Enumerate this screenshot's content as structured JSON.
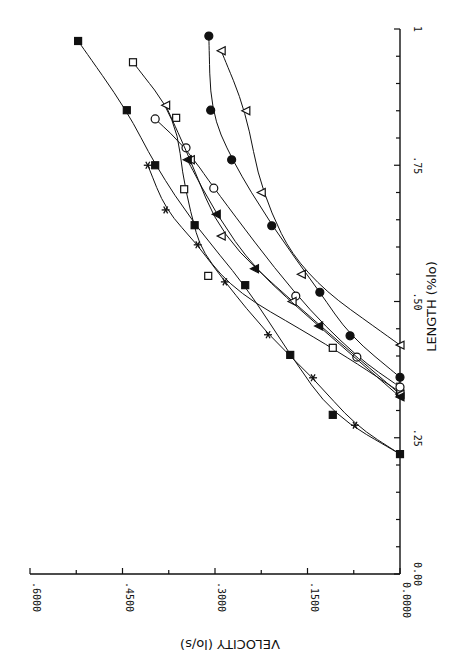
{
  "chart_data": {
    "type": "line",
    "orientation": "rotated-90-clockwise (page rotated; x axis drawn vertically on right, y axis drawn horizontally at bottom)",
    "title": "",
    "xlabel": "LENGTH (%lo)",
    "ylabel": "VELOCITY (lo/s)",
    "xlim": [
      0,
      1
    ],
    "ylim": [
      0,
      0.6
    ],
    "x_ticks": [
      "0.00",
      ".25",
      ".50",
      ".75",
      "1"
    ],
    "y_ticks": [
      "0.0000",
      ".1500",
      ".3000",
      ".4500",
      ".6000"
    ],
    "grid": false,
    "legend": "none",
    "series": [
      {
        "name": "filled-square",
        "marker": "square-filled",
        "x": [
          0.22,
          0.292,
          0.402,
          0.53,
          0.64,
          0.75,
          0.851,
          0.978
        ],
        "y": [
          0,
          0.109,
          0.178,
          0.251,
          0.333,
          0.397,
          0.443,
          0.522
        ]
      },
      {
        "name": "asterisk",
        "marker": "asterisk",
        "x": [
          0.22,
          0.273,
          0.36,
          0.439,
          0.536,
          0.604,
          0.668,
          0.75
        ],
        "y": [
          0,
          0.073,
          0.141,
          0.214,
          0.284,
          0.328,
          0.38,
          0.409
        ]
      },
      {
        "name": "open-square",
        "marker": "square-open",
        "x": [
          0.334,
          0.415,
          0.547,
          0.706,
          0.837,
          0.939
        ],
        "y": [
          0,
          0.109,
          0.311,
          0.35,
          0.363,
          0.433
        ]
      },
      {
        "name": "open-circle",
        "marker": "circle-open",
        "x": [
          0.343,
          0.398,
          0.51,
          0.708,
          0.782,
          0.835
        ],
        "y": [
          0,
          0.07,
          0.169,
          0.302,
          0.347,
          0.397
        ]
      },
      {
        "name": "open-triangle-left",
        "marker": "triangle-open",
        "x": [
          0.33,
          0.5,
          0.62,
          0.76,
          0.86
        ],
        "y": [
          0,
          0.175,
          0.29,
          0.34,
          0.38
        ]
      },
      {
        "name": "filled-triangle",
        "marker": "triangle-filled",
        "x": [
          0.325,
          0.455,
          0.56,
          0.66,
          0.76
        ],
        "y": [
          0,
          0.132,
          0.236,
          0.298,
          0.345
        ]
      },
      {
        "name": "open-triangle-right",
        "marker": "triangle-open",
        "x": [
          0.42,
          0.55,
          0.7,
          0.85,
          0.96
        ],
        "y": [
          0,
          0.16,
          0.225,
          0.25,
          0.29
        ]
      },
      {
        "name": "filled-circle",
        "marker": "circle-filled",
        "x": [
          0.361,
          0.437,
          0.517,
          0.639,
          0.76,
          0.851,
          0.987
        ],
        "y": [
          0,
          0.081,
          0.13,
          0.208,
          0.273,
          0.307,
          0.31
        ]
      }
    ]
  },
  "plot": {
    "origin_px": [
      400,
      574
    ],
    "x_len_px": 545,
    "y_len_px": 370
  }
}
